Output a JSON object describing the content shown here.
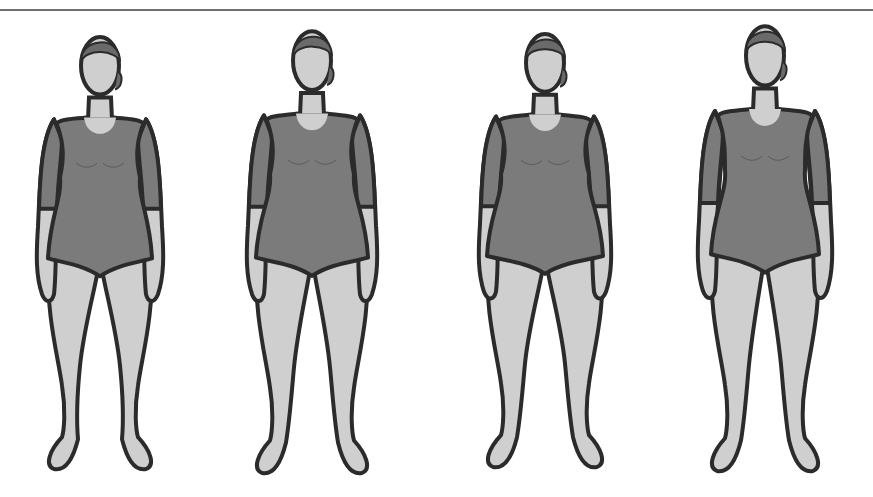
{
  "illustration": {
    "subject": "four female body shape figures in bodysuits",
    "colors": {
      "background": "#ffffff",
      "rule": "#6e6e6e",
      "outline": "#2b2b2b",
      "skin": "#cfcfcf",
      "bodysuit": "#7b7b7b",
      "hair": "#6a6a6a"
    },
    "figures": [
      {
        "id": "figure-1",
        "cx": 100,
        "top": 28,
        "height": 442,
        "shoulder": 52,
        "waist": 40,
        "hip": 52,
        "leg_gap": 10
      },
      {
        "id": "figure-2",
        "cx": 312,
        "top": 22,
        "height": 452,
        "shoulder": 54,
        "waist": 42,
        "hip": 56,
        "leg_gap": 8
      },
      {
        "id": "figure-3",
        "cx": 545,
        "top": 25,
        "height": 443,
        "shoulder": 55,
        "waist": 44,
        "hip": 58,
        "leg_gap": 10
      },
      {
        "id": "figure-4",
        "cx": 765,
        "top": 17,
        "height": 455,
        "shoulder": 56,
        "waist": 40,
        "hip": 54,
        "leg_gap": 6
      }
    ]
  }
}
